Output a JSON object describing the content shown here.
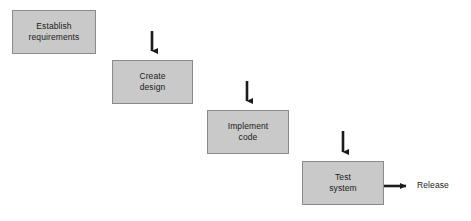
{
  "diagram": {
    "type": "flowchart",
    "background_color": "#ffffff",
    "box_fill_color": "#c9c9c9",
    "box_border_color": "#8a8a8a",
    "text_color": "#1b1b1b",
    "connector_color": "#1b1b1b",
    "stages": [
      {
        "id": "establish-requirements",
        "label": "Establish\nrequirements",
        "line1": "Establish",
        "line2": "requirements",
        "x": 12,
        "y": 10,
        "width": 84,
        "height": 44
      },
      {
        "id": "create-design",
        "label": "Create\ndesign",
        "line1": "Create",
        "line2": "design",
        "x": 112,
        "y": 60,
        "width": 81,
        "height": 44
      },
      {
        "id": "implement-code",
        "label": "Implement\ncode",
        "line1": "Implement",
        "line2": "code",
        "x": 207,
        "y": 110,
        "width": 82,
        "height": 44
      },
      {
        "id": "test-system",
        "label": "Test\nsystem",
        "line1": "Test",
        "line2": "system",
        "x": 302,
        "y": 161,
        "width": 82,
        "height": 44
      }
    ],
    "connectors": [
      {
        "id": "connector-requirements-to-design",
        "from": "establish-requirements",
        "to": "create-design",
        "shape": "elbow-right-down",
        "start_x": 96,
        "start_y": 32,
        "corner_x": 152,
        "end_y": 57
      },
      {
        "id": "connector-design-to-code",
        "from": "create-design",
        "to": "implement-code",
        "shape": "elbow-right-down",
        "start_x": 193,
        "start_y": 82,
        "corner_x": 247,
        "end_y": 107
      },
      {
        "id": "connector-code-to-test",
        "from": "implement-code",
        "to": "test-system",
        "shape": "elbow-right-down",
        "start_x": 289,
        "start_y": 132,
        "corner_x": 343,
        "end_y": 158
      },
      {
        "id": "connector-test-to-release",
        "from": "test-system",
        "to": "release",
        "shape": "straight-right",
        "start_x": 384,
        "start_y": 186,
        "end_x": 412
      }
    ],
    "output": {
      "id": "release",
      "label": "Release",
      "x": 417,
      "y": 180
    }
  }
}
